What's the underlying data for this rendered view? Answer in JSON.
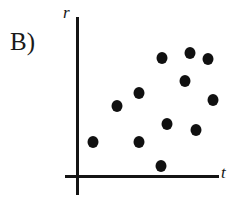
{
  "figure": {
    "panel_label": "B)",
    "background_color": "#ffffff",
    "ink_color": "#101010"
  },
  "chart_data": {
    "type": "scatter",
    "title": "",
    "subtitle": "",
    "panel": "B)",
    "xlabel": "t",
    "ylabel": "r",
    "xticklabels": [],
    "yticklabels": [],
    "grid": false,
    "legend": null,
    "axes_style": "two-line cross axes, no ticks, no numbers",
    "marker": {
      "shape": "circle",
      "filled": true,
      "color": "#101010",
      "size_px": 11
    },
    "n_points": 12,
    "note": "Qualitative scatter of r versus t with no numeric scale; values below are read in axis-relative units where the origin is (0,0) and the drawn axes span roughly t=0..1 and r=0..1.",
    "points": [
      {
        "px": 162,
        "py": 58,
        "t": 0.61,
        "r": 0.74
      },
      {
        "px": 190,
        "py": 53,
        "t": 0.8,
        "r": 0.77
      },
      {
        "px": 208,
        "py": 59,
        "t": 0.92,
        "r": 0.73
      },
      {
        "px": 185,
        "py": 81,
        "t": 0.77,
        "r": 0.59
      },
      {
        "px": 139,
        "py": 93,
        "t": 0.45,
        "r": 0.52
      },
      {
        "px": 213,
        "py": 100,
        "t": 0.96,
        "r": 0.47
      },
      {
        "px": 117,
        "py": 106,
        "t": 0.29,
        "r": 0.44
      },
      {
        "px": 167,
        "py": 124,
        "t": 0.64,
        "r": 0.32
      },
      {
        "px": 196,
        "py": 130,
        "t": 0.84,
        "r": 0.28
      },
      {
        "px": 93,
        "py": 142,
        "t": 0.12,
        "r": 0.21
      },
      {
        "px": 139,
        "py": 142,
        "t": 0.45,
        "r": 0.21
      },
      {
        "px": 161,
        "py": 166,
        "t": 0.6,
        "r": 0.06
      }
    ],
    "x": [
      0.61,
      0.8,
      0.92,
      0.77,
      0.45,
      0.96,
      0.29,
      0.64,
      0.84,
      0.12,
      0.45,
      0.6
    ],
    "y": [
      0.74,
      0.77,
      0.73,
      0.59,
      0.52,
      0.47,
      0.44,
      0.32,
      0.28,
      0.21,
      0.21,
      0.06
    ],
    "xlim": [
      0,
      1
    ],
    "ylim": [
      0,
      1
    ]
  }
}
